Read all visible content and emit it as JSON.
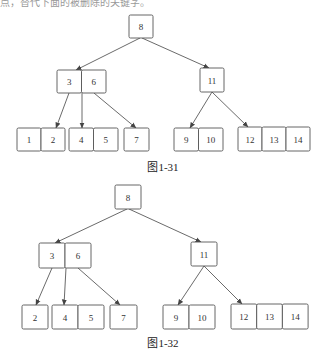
{
  "top_text": "点，替代下面的被删除的关键字。",
  "figures": [
    {
      "caption": "图1-31",
      "caption_pos": [
        163,
        171
      ],
      "nodes": [
        {
          "id": "root",
          "x": 129,
          "y": 15,
          "cell_w": 24,
          "h": 23,
          "keys": [
            "8"
          ]
        },
        {
          "id": "n36",
          "x": 57,
          "y": 70,
          "cell_w": 24.5,
          "h": 23,
          "keys": [
            "3",
            "6"
          ]
        },
        {
          "id": "n11",
          "x": 200,
          "y": 68,
          "cell_w": 24,
          "h": 24,
          "keys": [
            "11"
          ]
        },
        {
          "id": "l12",
          "x": 17,
          "y": 128,
          "cell_w": 24,
          "h": 23,
          "keys": [
            "1",
            "2"
          ]
        },
        {
          "id": "l45",
          "x": 69,
          "y": 128,
          "cell_w": 24.5,
          "h": 23,
          "keys": [
            "4",
            "5"
          ]
        },
        {
          "id": "l7",
          "x": 124,
          "y": 128,
          "cell_w": 25,
          "h": 23,
          "keys": [
            "7"
          ]
        },
        {
          "id": "l910",
          "x": 174,
          "y": 128,
          "cell_w": 24.5,
          "h": 23,
          "keys": [
            "9",
            "10"
          ]
        },
        {
          "id": "l121314",
          "x": 238,
          "y": 127,
          "cell_w": 24,
          "h": 24,
          "keys": [
            "12",
            "13",
            "14"
          ]
        }
      ],
      "edges": [
        {
          "from": [
            140,
            38
          ],
          "to": [
            76,
            70
          ]
        },
        {
          "from": [
            142,
            38
          ],
          "to": [
            209,
            68
          ]
        },
        {
          "from": [
            69,
            93
          ],
          "to": [
            56,
            128
          ]
        },
        {
          "from": [
            82,
            93
          ],
          "to": [
            82,
            128
          ]
        },
        {
          "from": [
            94,
            93
          ],
          "to": [
            136,
            128
          ]
        },
        {
          "from": [
            212,
            92
          ],
          "to": [
            190,
            128
          ]
        },
        {
          "from": [
            212,
            92
          ],
          "to": [
            248,
            127
          ]
        }
      ]
    },
    {
      "caption": "图1-32",
      "caption_pos": [
        163,
        347
      ],
      "nodes": [
        {
          "id": "root",
          "x": 115,
          "y": 185,
          "cell_w": 26,
          "h": 24,
          "keys": [
            "8"
          ]
        },
        {
          "id": "n36",
          "x": 39,
          "y": 243,
          "cell_w": 26,
          "h": 25,
          "keys": [
            "3",
            "6"
          ]
        },
        {
          "id": "n11",
          "x": 191,
          "y": 242,
          "cell_w": 26,
          "h": 24,
          "keys": [
            "11"
          ]
        },
        {
          "id": "l2",
          "x": 22,
          "y": 305,
          "cell_w": 26,
          "h": 24,
          "keys": [
            "2"
          ]
        },
        {
          "id": "l45",
          "x": 52,
          "y": 305,
          "cell_w": 26,
          "h": 24,
          "keys": [
            "4",
            "5"
          ]
        },
        {
          "id": "l7",
          "x": 110,
          "y": 305,
          "cell_w": 27,
          "h": 24,
          "keys": [
            "7"
          ]
        },
        {
          "id": "l910",
          "x": 163,
          "y": 305,
          "cell_w": 26,
          "h": 24,
          "keys": [
            "9",
            "10"
          ]
        },
        {
          "id": "l121314",
          "x": 231,
          "y": 304,
          "cell_w": 25.7,
          "h": 25,
          "keys": [
            "12",
            "13",
            "14"
          ]
        }
      ],
      "edges": [
        {
          "from": [
            127,
            209
          ],
          "to": [
            55,
            243
          ]
        },
        {
          "from": [
            129,
            209
          ],
          "to": [
            201,
            242
          ]
        },
        {
          "from": [
            52,
            268
          ],
          "to": [
            36,
            305
          ]
        },
        {
          "from": [
            66,
            268
          ],
          "to": [
            64,
            305
          ]
        },
        {
          "from": [
            78,
            268
          ],
          "to": [
            120,
            305
          ]
        },
        {
          "from": [
            204,
            266
          ],
          "to": [
            178,
            305
          ]
        },
        {
          "from": [
            204,
            266
          ],
          "to": [
            242,
            304
          ]
        }
      ]
    }
  ]
}
